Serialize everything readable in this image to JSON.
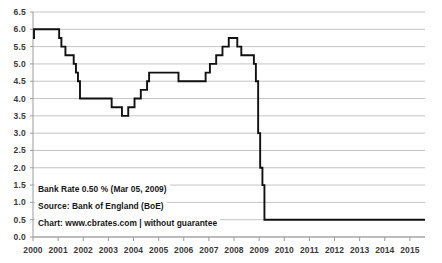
{
  "chart_data": {
    "type": "line",
    "title": "",
    "subtitle": "",
    "xlabel": "",
    "ylabel": "",
    "grid": true,
    "legend_position": "none",
    "step": "post",
    "xlim": [
      2000.0,
      2015.6
    ],
    "ylim": [
      0.0,
      6.5
    ],
    "ytick_labels": [
      "0.0",
      "0.5",
      "1.0",
      "1.5",
      "2.0",
      "2.5",
      "3.0",
      "3.5",
      "4.0",
      "4.5",
      "5.0",
      "5.5",
      "6.0",
      "6.5"
    ],
    "ytick_values": [
      0.0,
      0.5,
      1.0,
      1.5,
      2.0,
      2.5,
      3.0,
      3.5,
      4.0,
      4.5,
      5.0,
      5.5,
      6.0,
      6.5
    ],
    "xtick_labels": [
      "2000",
      "2001",
      "2002",
      "2003",
      "2004",
      "2005",
      "2006",
      "2007",
      "2008",
      "2009",
      "2010",
      "2011",
      "2012",
      "2013",
      "2014",
      "2015"
    ],
    "xtick_values": [
      2000,
      2001,
      2002,
      2003,
      2004,
      2005,
      2006,
      2007,
      2008,
      2009,
      2010,
      2011,
      2012,
      2013,
      2014,
      2015
    ],
    "series": [
      {
        "name": "Bank Rate",
        "color": "#111111",
        "x": [
          2000.0,
          2000.04,
          2000.13,
          2001.04,
          2001.13,
          2001.29,
          2001.37,
          2001.62,
          2001.71,
          2001.79,
          2001.87,
          2002.0,
          2003.13,
          2003.29,
          2003.54,
          2003.79,
          2003.87,
          2004.04,
          2004.29,
          2004.37,
          2004.54,
          2004.62,
          2005.62,
          2005.79,
          2006.62,
          2006.87,
          2007.04,
          2007.29,
          2007.54,
          2007.79,
          2007.96,
          2008.13,
          2008.29,
          2008.79,
          2008.87,
          2008.96,
          2009.04,
          2009.13,
          2009.21,
          2015.6
        ],
        "y": [
          5.75,
          6.0,
          6.0,
          5.75,
          5.5,
          5.25,
          5.25,
          5.0,
          4.75,
          4.5,
          4.0,
          4.0,
          3.75,
          3.75,
          3.5,
          3.75,
          3.75,
          4.0,
          4.25,
          4.25,
          4.5,
          4.75,
          4.75,
          4.5,
          4.5,
          4.75,
          5.0,
          5.25,
          5.5,
          5.75,
          5.75,
          5.5,
          5.25,
          5.0,
          4.5,
          3.0,
          2.0,
          1.5,
          0.5,
          0.5
        ],
        "values_note": "UK Bank Rate, % per annum"
      }
    ],
    "annotations": [
      "Bank Rate 0.50 % (Mar 05, 2009)",
      "Source: Bank of England (BoE)",
      "Chart: www.cbrates.com | without guarantee"
    ],
    "colors": {
      "line": "#111111",
      "grid": "#bdbdbd",
      "axis": "#9a9a9a",
      "text": "#3a3a3a",
      "background": "#ffffff"
    }
  },
  "annotations": {
    "bank_rate": "Bank Rate 0.50 % (Mar 05, 2009)",
    "source": "Source: Bank of England (BoE)",
    "chart_credit": "Chart: www.cbrates.com | without guarantee"
  }
}
